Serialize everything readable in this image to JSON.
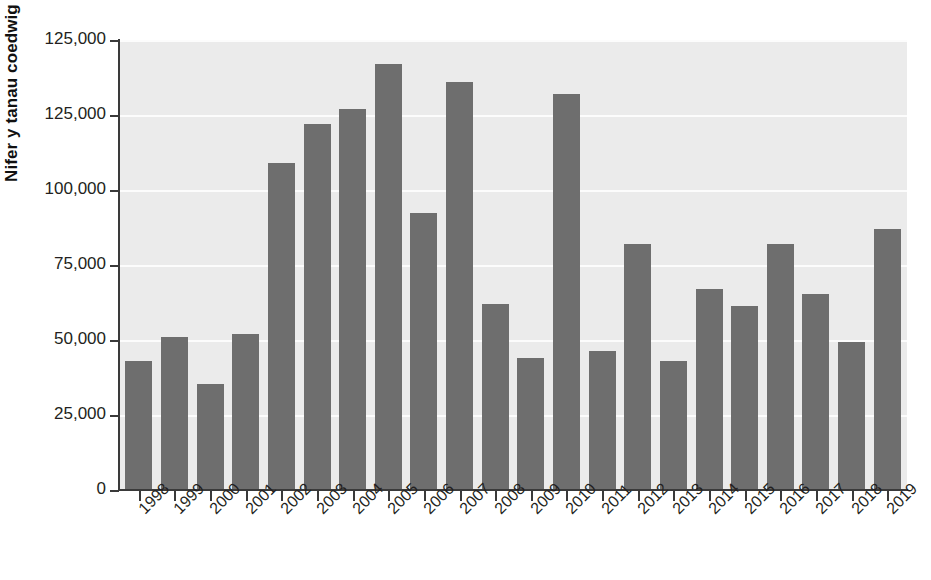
{
  "chart_data": {
    "type": "bar",
    "title": "",
    "xlabel": "",
    "ylabel": "Nifer y tanau coedwig",
    "categories": [
      "1998",
      "1999",
      "2000",
      "2001",
      "2002",
      "2003",
      "2004",
      "2005",
      "2006",
      "2007",
      "2008",
      "2009",
      "2010",
      "2011",
      "2012",
      "2013",
      "2014",
      "2015",
      "2016",
      "2017",
      "2018",
      "2019"
    ],
    "values": [
      43000,
      51000,
      35500,
      52000,
      109000,
      122000,
      127000,
      142000,
      92500,
      136000,
      62000,
      44000,
      132000,
      46500,
      82000,
      43000,
      67000,
      61500,
      82000,
      65500,
      49500,
      87000
    ],
    "y_tick_labels": [
      "125,000",
      "125,000",
      "100,000",
      "75,000",
      "50,000",
      "25,000",
      "0"
    ],
    "y_tick_values": [
      150000,
      125000,
      100000,
      75000,
      50000,
      25000,
      0
    ],
    "ylim": [
      0,
      150000
    ],
    "grid": true,
    "legend": false,
    "bar_color": "#6e6e6e",
    "plot_background": "#ebebeb",
    "gridline_color": "#fdfdfd",
    "axis_color": "#3a3a3a",
    "text_color": "#231f20",
    "x_tick_rotation": "-45"
  },
  "ghost_text": {
    "lines": [
      "a deall o'r cyfnod hwn, sydd gan y wybodaeth",
      "ae'r cyfnod wedi bod yn gysylltiedig â'r",
      "ymchwil i newid hinsawdd a'r tanau coedwig",
      "effaith ar adnoddau naturiol, y gymdeithas",
      "ac amodau hinsoddol mewn rhanbarthau eraill."
    ]
  }
}
